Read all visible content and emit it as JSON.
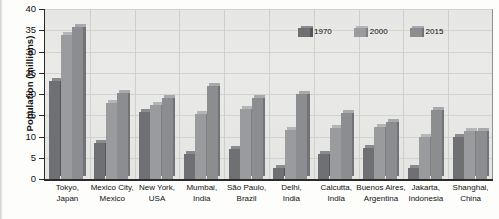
{
  "chart_data": {
    "type": "bar",
    "title": "",
    "xlabel": "",
    "ylabel": "Population (millions)",
    "ylim": [
      0,
      40
    ],
    "ytick_step": 5,
    "yticks": [
      "0",
      "5",
      "10",
      "15",
      "20",
      "25",
      "30",
      "35",
      "40"
    ],
    "grid": true,
    "legend_position": "top-right",
    "categories": [
      "Tokyo,\nJapan",
      "Mexico City,\nMexico",
      "New York,\nUSA",
      "Mumbai,\nIndia",
      "São Paulo,\nBrazil",
      "Delhi,\nIndia",
      "Calcutta,\nIndia",
      "Buenos Aires,\nArgentina",
      "Jakarta,\nIndonesia",
      "Shanghai,\nChina"
    ],
    "category_lines": [
      [
        "Tokyo,",
        "Japan"
      ],
      [
        "Mexico City,",
        "Mexico"
      ],
      [
        "New York,",
        "USA"
      ],
      [
        "Mumbai,",
        "India"
      ],
      [
        "São Paulo,",
        "Brazil"
      ],
      [
        "Delhi,",
        "India"
      ],
      [
        "Calcutta,",
        "India"
      ],
      [
        "Buenos Aires,",
        "Argentina"
      ],
      [
        "Jakarta,",
        "Indonesia"
      ],
      [
        "Shanghai,",
        "China"
      ]
    ],
    "series": [
      {
        "name": "1970",
        "color": "#6f7073",
        "values": [
          23.0,
          8.5,
          15.8,
          5.8,
          7.0,
          2.6,
          6.0,
          7.3,
          2.7,
          9.8
        ]
      },
      {
        "name": "2000",
        "color": "#9a9b9d",
        "values": [
          34.0,
          17.8,
          17.3,
          15.4,
          16.4,
          11.5,
          12.0,
          12.2,
          9.8,
          11.4
        ]
      },
      {
        "name": "2015",
        "color": "#8c8d90",
        "values": [
          35.7,
          20.2,
          19.0,
          21.9,
          19.0,
          20.0,
          15.5,
          13.4,
          16.2,
          11.2
        ]
      }
    ]
  },
  "legend": {
    "items": [
      {
        "label": "1970"
      },
      {
        "label": "2000"
      },
      {
        "label": "2015"
      }
    ]
  }
}
